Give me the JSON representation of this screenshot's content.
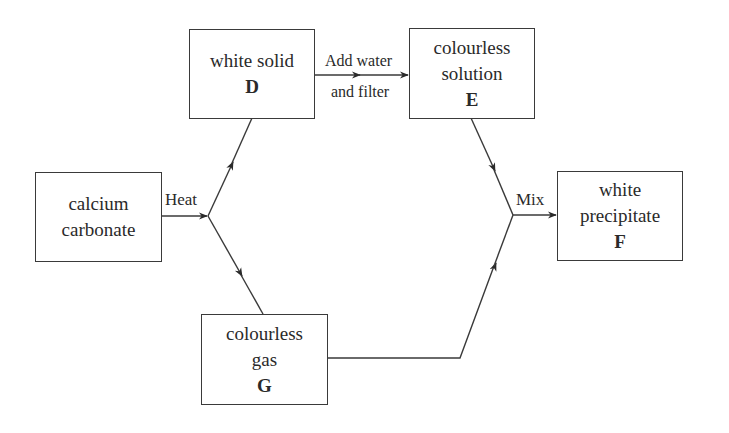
{
  "nodes": {
    "start": {
      "lines": [
        "calcium",
        "carbonate"
      ]
    },
    "D": {
      "lines": [
        "white solid"
      ],
      "id": "D"
    },
    "E": {
      "lines": [
        "colourless",
        "solution"
      ],
      "id": "E"
    },
    "F": {
      "lines": [
        "white",
        "precipitate"
      ],
      "id": "F"
    },
    "G": {
      "lines": [
        "colourless",
        "gas"
      ],
      "id": "G"
    }
  },
  "edges": {
    "heat": "Heat",
    "add_water_1": "Add water",
    "add_water_2": "and filter",
    "mix": "Mix"
  },
  "colors": {
    "line": "#3a3a3a",
    "background": "#ffffff"
  }
}
